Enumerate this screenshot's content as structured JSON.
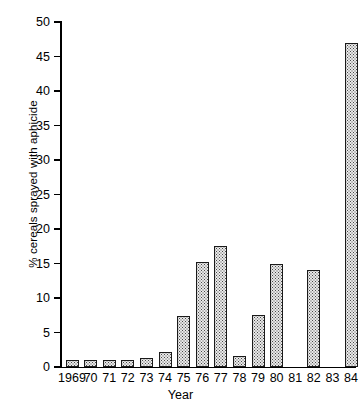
{
  "chart_data": {
    "type": "bar",
    "title": "",
    "xlabel": "Year",
    "ylabel": "% cereals sprayed with aphicide",
    "categories": [
      "1969",
      "70",
      "71",
      "72",
      "73",
      "74",
      "75",
      "76",
      "77",
      "78",
      "79",
      "80",
      "81",
      "82",
      "83",
      "84"
    ],
    "values": [
      1.0,
      1.0,
      1.0,
      1.0,
      1.3,
      2.2,
      7.4,
      15.2,
      17.5,
      1.6,
      7.5,
      14.9,
      0,
      14.0,
      0,
      47.0
    ],
    "ylim": [
      0,
      50
    ],
    "yticks": [
      0,
      5,
      10,
      15,
      20,
      25,
      30,
      35,
      40,
      45,
      50
    ],
    "ytick_labels": [
      "0",
      "5",
      "10",
      "15",
      "20",
      "25",
      "30",
      "35",
      "40",
      "45",
      "50"
    ],
    "grid": false,
    "legend": "none",
    "bar_face_color": "#e9e9e9",
    "bar_edge_color": "#1a1a1a",
    "axis_color": "#000000"
  }
}
